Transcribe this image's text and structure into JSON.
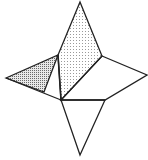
{
  "figure": {
    "stroke_color": "#222222",
    "background": "#ffffff",
    "vertices": {
      "top": [
        80,
        2
      ],
      "upper_right": [
        102,
        56
      ],
      "right_tip": [
        147,
        75
      ],
      "lower_right": [
        105,
        100
      ],
      "center": [
        61,
        100
      ],
      "bottom_tip": [
        80,
        155
      ],
      "upper_left": [
        58,
        55
      ],
      "left_tip": [
        6,
        78
      ],
      "left_bottom": [
        44,
        92
      ]
    },
    "faces": [
      {
        "name": "upper-kite",
        "points": "80,2 102,56 61,100 58,55",
        "fill": "light-dots"
      },
      {
        "name": "left-triangle",
        "points": "6,78 58,55 44,92",
        "fill": "dense-dots"
      },
      {
        "name": "left-lower-triangle",
        "points": "6,78 44,92 61,100",
        "fill": "none"
      },
      {
        "name": "right-quad",
        "points": "102,56 147,75 105,100 61,100",
        "fill": "none"
      },
      {
        "name": "bottom-triangle",
        "points": "61,100 105,100 80,155",
        "fill": "none"
      }
    ]
  }
}
